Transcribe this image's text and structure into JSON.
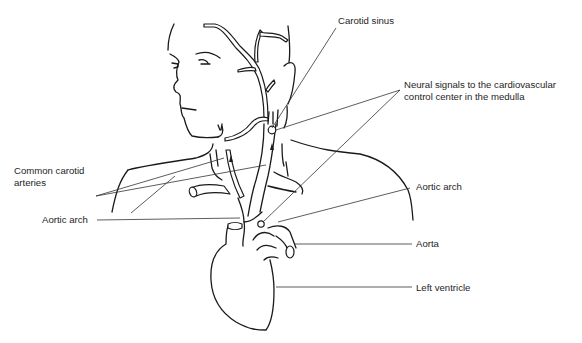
{
  "figure": {
    "labels": {
      "carotid_sinus": "Carotid sinus",
      "neural_signals_line1": "Neural signals to the cardiovascular",
      "neural_signals_line2": "control center in the medulla",
      "common_carotid_line1": "Common carotid",
      "common_carotid_line2": "arteries",
      "aortic_arch_left": "Aortic arch",
      "aortic_arch_right": "Aortic arch",
      "aorta": "Aorta",
      "left_ventricle": "Left ventricle"
    },
    "colors": {
      "ink": "#1a1a1a",
      "text": "#1e1e1e",
      "background": "#ffffff"
    }
  }
}
